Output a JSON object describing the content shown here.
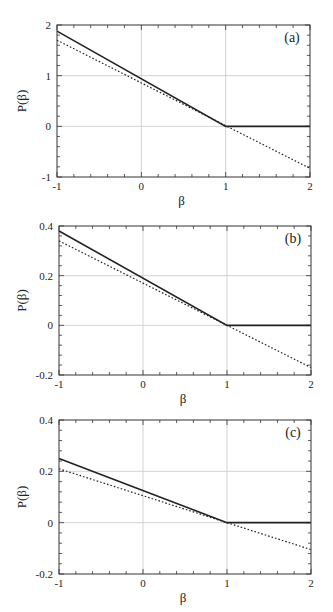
{
  "chart_data": [
    {
      "type": "line",
      "panel_label": "(a)",
      "title": "",
      "xlabel": "β",
      "ylabel": "P(β)",
      "xlim": [
        -1,
        2
      ],
      "ylim": [
        -1,
        2
      ],
      "xticks": [
        "-1",
        "0",
        "1",
        "2"
      ],
      "yticks": [
        "-1",
        "0",
        "1",
        "2"
      ],
      "grid": true,
      "series": [
        {
          "name": "solid",
          "style": "solid",
          "x": [
            -1,
            1,
            2
          ],
          "y": [
            1.88,
            0,
            0
          ]
        },
        {
          "name": "dotted",
          "style": "dotted",
          "x": [
            -1,
            2
          ],
          "y": [
            1.7,
            -0.83
          ]
        }
      ]
    },
    {
      "type": "line",
      "panel_label": "(b)",
      "title": "",
      "xlabel": "β",
      "ylabel": "P(β)",
      "xlim": [
        -1,
        2
      ],
      "ylim": [
        -0.2,
        0.4
      ],
      "xticks": [
        "-1",
        "0",
        "1",
        "2"
      ],
      "yticks": [
        "-0.2",
        "0",
        "0.2",
        "0.4"
      ],
      "grid": true,
      "series": [
        {
          "name": "solid",
          "style": "solid",
          "x": [
            -1,
            1,
            2
          ],
          "y": [
            0.38,
            0,
            0
          ]
        },
        {
          "name": "dotted",
          "style": "dotted",
          "x": [
            -1,
            2
          ],
          "y": [
            0.34,
            -0.17
          ]
        }
      ]
    },
    {
      "type": "line",
      "panel_label": "(c)",
      "title": "",
      "xlabel": "β",
      "ylabel": "P(β)",
      "xlim": [
        -1,
        2
      ],
      "ylim": [
        -0.2,
        0.4
      ],
      "xticks": [
        "-1",
        "0",
        "1",
        "2"
      ],
      "yticks": [
        "-0.2",
        "0",
        "0.2",
        "0.4"
      ],
      "grid": true,
      "series": [
        {
          "name": "solid",
          "style": "solid",
          "x": [
            -1,
            1,
            2
          ],
          "y": [
            0.25,
            0,
            0
          ]
        },
        {
          "name": "dotted",
          "style": "dotted",
          "x": [
            -1,
            2
          ],
          "y": [
            0.21,
            -0.105
          ]
        }
      ]
    }
  ],
  "layout": [
    {
      "left": 57,
      "right": 310,
      "top": 25,
      "bottom": 177
    },
    {
      "left": 59,
      "right": 311,
      "top": 226,
      "bottom": 375
    },
    {
      "left": 59,
      "right": 311,
      "top": 420,
      "bottom": 574
    }
  ]
}
